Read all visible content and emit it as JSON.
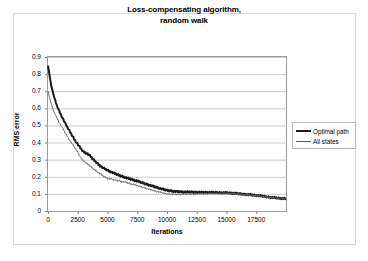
{
  "chart_data": {
    "type": "line",
    "title": "Loss-compensating algorithm, random walk",
    "title_line1": "Loss-compensating algorithm,",
    "title_line2": "random walk",
    "xlabel": "Iterations",
    "ylabel": "RMS error",
    "xlim": [
      0,
      20000
    ],
    "ylim": [
      0,
      0.9
    ],
    "xticks": [
      0,
      2500,
      5000,
      7500,
      10000,
      12500,
      15000,
      17500
    ],
    "xtick_labels": [
      "0",
      "2500",
      "5000",
      "7500",
      "10000",
      "12500",
      "15000",
      "17500"
    ],
    "yticks": [
      0,
      0.1,
      0.2,
      0.3,
      0.4,
      0.5,
      0.6,
      0.7,
      0.8,
      0.9
    ],
    "ytick_labels": [
      "0",
      "0.1",
      "0.2",
      "0.3",
      "0.4",
      "0.5",
      "0.6",
      "0.7",
      "0.8",
      "0.9"
    ],
    "grid": "horizontal",
    "legend_position": "right",
    "series": [
      {
        "name": "Optimal path",
        "color": "#1a1a1a",
        "linewidth": 2,
        "x": [
          0,
          250,
          500,
          750,
          1000,
          1250,
          1500,
          1750,
          2000,
          2250,
          2500,
          2750,
          3000,
          3250,
          3500,
          3750,
          4000,
          4250,
          4500,
          4750,
          5000,
          5500,
          6000,
          6500,
          7000,
          7500,
          8000,
          8500,
          9000,
          9500,
          10000,
          10500,
          11000,
          11500,
          12000,
          12500,
          13000,
          13500,
          14000,
          14500,
          15000,
          15500,
          16000,
          16500,
          17000,
          17500,
          18000,
          18500,
          19000,
          19500,
          19900
        ],
        "values": [
          0.85,
          0.74,
          0.67,
          0.615,
          0.575,
          0.54,
          0.505,
          0.475,
          0.445,
          0.415,
          0.39,
          0.365,
          0.345,
          0.337,
          0.325,
          0.305,
          0.288,
          0.272,
          0.258,
          0.247,
          0.238,
          0.222,
          0.208,
          0.196,
          0.185,
          0.175,
          0.163,
          0.152,
          0.141,
          0.13,
          0.121,
          0.116,
          0.113,
          0.111,
          0.111,
          0.11,
          0.109,
          0.109,
          0.108,
          0.107,
          0.107,
          0.104,
          0.101,
          0.098,
          0.095,
          0.091,
          0.087,
          0.082,
          0.078,
          0.074,
          0.072
        ]
      },
      {
        "name": "All states",
        "color": "#666666",
        "linewidth": 1,
        "x": [
          0,
          250,
          500,
          750,
          1000,
          1250,
          1500,
          1750,
          2000,
          2250,
          2500,
          2750,
          3000,
          3250,
          3500,
          3750,
          4000,
          4250,
          4500,
          4750,
          5000,
          5500,
          6000,
          6500,
          7000,
          7500,
          8000,
          8500,
          9000,
          9500,
          10000,
          10500,
          11000,
          11500,
          12000,
          12500,
          13000,
          13500,
          14000,
          14500,
          15000,
          15500,
          16000,
          16500,
          17000,
          17500,
          18000,
          18500,
          19000,
          19500,
          19900
        ],
        "values": [
          0.7,
          0.63,
          0.58,
          0.545,
          0.51,
          0.48,
          0.45,
          0.42,
          0.395,
          0.37,
          0.345,
          0.31,
          0.292,
          0.278,
          0.265,
          0.25,
          0.237,
          0.224,
          0.212,
          0.2,
          0.191,
          0.183,
          0.176,
          0.168,
          0.158,
          0.148,
          0.137,
          0.127,
          0.117,
          0.108,
          0.1,
          0.098,
          0.097,
          0.098,
          0.099,
          0.1,
          0.101,
          0.102,
          0.103,
          0.104,
          0.104,
          0.102,
          0.099,
          0.096,
          0.093,
          0.089,
          0.085,
          0.081,
          0.077,
          0.074,
          0.072
        ]
      }
    ],
    "colors": {
      "grid": "#cccccc",
      "axis": "#808080",
      "frame": "#d8d8d8",
      "background": "#ffffff",
      "text": "#000000"
    }
  },
  "legend": {
    "items": [
      {
        "label": "Optimal path"
      },
      {
        "label": "All states"
      }
    ]
  }
}
